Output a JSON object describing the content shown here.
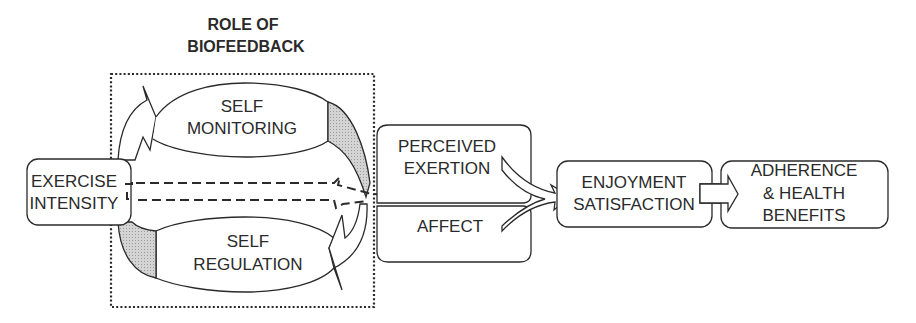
{
  "title": {
    "line1": "ROLE OF",
    "line2": "BIOFEEDBACK"
  },
  "nodes": {
    "exercise_intensity": {
      "line1": "EXERCISE",
      "line2": "INTENSITY"
    },
    "self_monitoring": {
      "line1": "SELF",
      "line2": "MONITORING"
    },
    "self_regulation": {
      "line1": "SELF",
      "line2": "REGULATION"
    },
    "perceived_exertion": {
      "line1": "PERCEIVED",
      "line2": "EXERTION"
    },
    "affect": {
      "line1": "AFFECT"
    },
    "enjoyment": {
      "line1": "ENJOYMENT",
      "line2": "SATISFACTION"
    },
    "adherence": {
      "line1": "ADHERENCE",
      "line2": "& HEALTH",
      "line3": "BENEFITS"
    }
  },
  "edges": [
    {
      "from": "exercise_intensity",
      "to": "self_monitoring",
      "style": "open-arrow"
    },
    {
      "from": "self_monitoring",
      "to": "perceived_exertion",
      "style": "shaded-curve"
    },
    {
      "from": "exercise_intensity",
      "to": "self_regulation",
      "style": "shaded-curve"
    },
    {
      "from": "self_regulation",
      "to": "perceived_exertion",
      "style": "open-arrow"
    },
    {
      "from": "exercise_intensity",
      "to": "perceived_exertion",
      "style": "dashed-arrow"
    },
    {
      "from": "perceived_exertion",
      "to": "enjoyment",
      "style": "open-arrow"
    },
    {
      "from": "affect",
      "to": "enjoyment",
      "style": "open-arrow"
    },
    {
      "from": "enjoyment",
      "to": "adherence",
      "style": "block-arrow"
    }
  ],
  "colors": {
    "stroke": "#2a2a2a",
    "shade": "#c8c8c8",
    "background": "#ffffff"
  }
}
